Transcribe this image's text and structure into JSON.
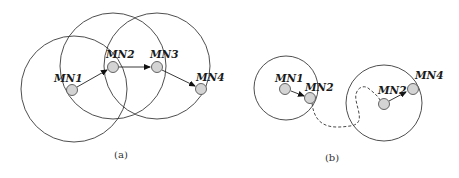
{
  "panels": {
    "a": {
      "caption": "(a)",
      "nodes": [
        {
          "id": "MN1",
          "label": "MN1"
        },
        {
          "id": "MN2",
          "label": "MN2"
        },
        {
          "id": "MN3",
          "label": "MN3"
        },
        {
          "id": "MN4",
          "label": "MN4"
        }
      ],
      "edges": [
        {
          "from": "MN1",
          "to": "MN2",
          "style": "solid-arrow"
        },
        {
          "from": "MN2",
          "to": "MN3",
          "style": "solid-arrow"
        },
        {
          "from": "MN3",
          "to": "MN4",
          "style": "solid-arrow"
        }
      ],
      "coverage_ranges": [
        "MN1",
        "MN2",
        "MN3"
      ]
    },
    "b": {
      "caption": "(b)",
      "nodes": [
        {
          "id": "MN1",
          "label": "MN1"
        },
        {
          "id": "MN2_before",
          "label": "MN2"
        },
        {
          "id": "MN2_after",
          "label": "MN2"
        },
        {
          "id": "MN4",
          "label": "MN4"
        }
      ],
      "edges": [
        {
          "from": "MN1",
          "to": "MN2_before",
          "style": "solid-arrow"
        },
        {
          "from": "MN2_before",
          "to": "MN2_after",
          "style": "dashed-movement-path"
        },
        {
          "from": "MN2_after",
          "to": "MN4",
          "style": "solid-arrow"
        }
      ],
      "coverage_ranges": [
        "MN1",
        "MN2_after"
      ]
    }
  }
}
